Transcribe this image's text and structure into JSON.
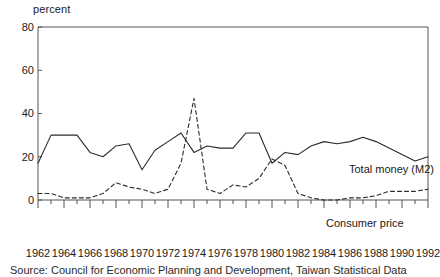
{
  "chart_data": {
    "type": "line",
    "title": "",
    "subtitle": "",
    "xlabel": "",
    "ylabel": "percent",
    "ylim": [
      0,
      80
    ],
    "xlim": [
      1962,
      1992
    ],
    "yticks": [
      0,
      20,
      40,
      60,
      80
    ],
    "xticks": [
      1962,
      1964,
      1966,
      1968,
      1970,
      1972,
      1974,
      1976,
      1978,
      1980,
      1982,
      1984,
      1986,
      1988,
      1990,
      1992
    ],
    "xtick_labels": [
      "1962",
      "1964",
      "1966",
      "1968",
      "1970",
      "1972",
      "1974",
      "1976",
      "1978",
      "1980",
      "1982",
      "1984",
      "1986",
      "1988",
      "1990",
      "1992"
    ],
    "ytick_labels": [
      "0",
      "20",
      "40",
      "60",
      "80"
    ],
    "grid": false,
    "legend_position": "inline-annotation",
    "x": [
      1962,
      1963,
      1964,
      1965,
      1966,
      1967,
      1968,
      1969,
      1970,
      1971,
      1972,
      1973,
      1974,
      1975,
      1976,
      1977,
      1978,
      1979,
      1980,
      1981,
      1982,
      1983,
      1984,
      1985,
      1986,
      1987,
      1988,
      1989,
      1990,
      1991,
      1992
    ],
    "series": [
      {
        "name": "Total money (M2)",
        "style": "solid",
        "color": "#2b2b2b",
        "values": [
          17,
          30,
          30,
          30,
          22,
          20,
          25,
          26,
          14,
          23,
          27,
          31,
          22,
          25,
          24,
          24,
          31,
          31,
          17,
          22,
          21,
          25,
          27,
          26,
          27,
          29,
          27,
          24,
          21,
          18,
          20
        ]
      },
      {
        "name": "Consumer price",
        "style": "dashed",
        "color": "#2b2b2b",
        "values": [
          3,
          3,
          1,
          1,
          1,
          3,
          8,
          6,
          5,
          3,
          5,
          17,
          47,
          5,
          3,
          7,
          6,
          10,
          19,
          16,
          3,
          1,
          0,
          0,
          1,
          1,
          2,
          4,
          4,
          4,
          5
        ]
      }
    ],
    "annotations": [
      {
        "name": "total-money-label",
        "text": "Total money (M2)",
        "x": 1985,
        "y": 32
      },
      {
        "name": "consumer-price-label",
        "text": "Consumer price",
        "x": 1983,
        "y": 7
      }
    ]
  },
  "axes": {
    "y_unit_caption": "percent"
  },
  "source": {
    "note": "Source: Council for Economic Planning and Development, Taiwan Statistical Data"
  }
}
